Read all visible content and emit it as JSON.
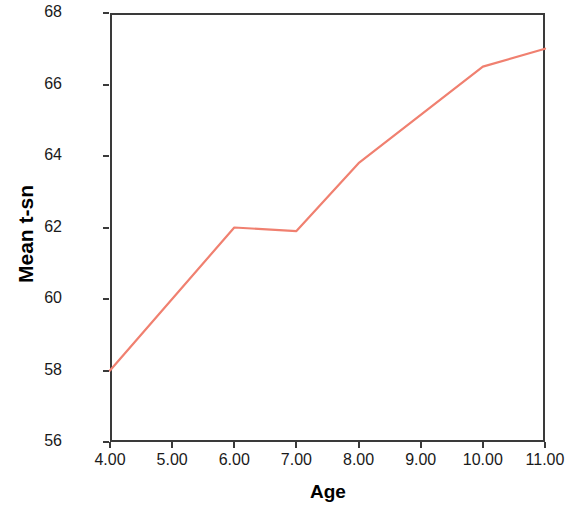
{
  "chart_data": {
    "type": "line",
    "title": "",
    "xlabel": "Age",
    "ylabel": "Mean t-sn",
    "x": [
      4,
      5,
      6,
      7,
      8,
      9,
      10,
      11
    ],
    "xtick_labels": [
      "4.00",
      "5.00",
      "6.00",
      "7.00",
      "8.00",
      "9.00",
      "10.00",
      "11.00"
    ],
    "ytick_labels": [
      "56",
      "58",
      "60",
      "62",
      "64",
      "66",
      "68"
    ],
    "ytick_values": [
      56,
      58,
      60,
      62,
      64,
      66,
      68
    ],
    "xlim": [
      4,
      11
    ],
    "ylim": [
      56,
      68
    ],
    "grid": false,
    "legend": null,
    "series": [
      {
        "name": "Mean t-sn",
        "color": "#F08070",
        "marked_x": [
          4,
          6,
          7,
          8,
          10,
          11
        ],
        "marked_values": [
          58.0,
          62.0,
          61.9,
          63.8,
          66.5,
          67.0
        ],
        "values": [
          58.0,
          60.0,
          62.0,
          61.9,
          63.8,
          65.15,
          66.5,
          67.0
        ]
      }
    ]
  },
  "axes": {
    "y_title": "Mean t-sn",
    "x_title": "Age"
  }
}
